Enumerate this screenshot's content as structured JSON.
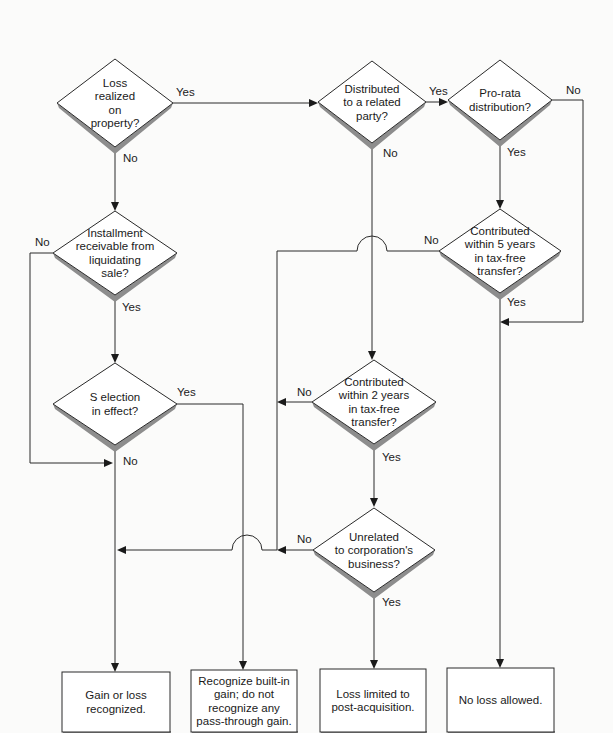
{
  "diagram": {
    "type": "flowchart",
    "decisions": [
      {
        "id": "loss_realized",
        "lines": [
          "Loss",
          "realized",
          "on",
          "property?"
        ],
        "cx": 115,
        "cy": 103,
        "hw": 58,
        "hh": 44
      },
      {
        "id": "distributed_related",
        "lines": [
          "Distributed",
          "to a related",
          "party?"
        ],
        "cx": 372,
        "cy": 102,
        "hw": 54,
        "hh": 41
      },
      {
        "id": "pro_rata",
        "lines": [
          "Pro-rata",
          "distribution?"
        ],
        "cx": 500,
        "cy": 100,
        "hw": 52,
        "hh": 40
      },
      {
        "id": "installment",
        "lines": [
          "Installment",
          "receivable from",
          "liquidating",
          "sale?"
        ],
        "cx": 115,
        "cy": 253,
        "hw": 62,
        "hh": 42
      },
      {
        "id": "contributed_5",
        "lines": [
          "Contributed",
          "within 5 years",
          "in tax-free",
          "transfer?"
        ],
        "cx": 500,
        "cy": 251,
        "hw": 61,
        "hh": 42
      },
      {
        "id": "s_election",
        "lines": [
          "S election",
          "in effect?"
        ],
        "cx": 115,
        "cy": 404,
        "hw": 62,
        "hh": 41
      },
      {
        "id": "contributed_2",
        "lines": [
          "Contributed",
          "within 2 years",
          "in tax-free",
          "transfer?"
        ],
        "cx": 374,
        "cy": 402,
        "hw": 62,
        "hh": 42
      },
      {
        "id": "unrelated",
        "lines": [
          "Unrelated",
          "to corporation's",
          "business?"
        ],
        "cx": 374,
        "cy": 550,
        "hw": 61,
        "hh": 42
      }
    ],
    "outcomes": [
      {
        "id": "gain_loss_recognized",
        "lines": [
          "Gain or loss",
          "recognized."
        ],
        "x": 62,
        "y": 672,
        "w": 108,
        "h": 60
      },
      {
        "id": "recognize_built_in",
        "lines": [
          "Recognize built-in",
          "gain; do not",
          "recognize any",
          "pass-through gain."
        ],
        "x": 191,
        "y": 670,
        "w": 106,
        "h": 62
      },
      {
        "id": "loss_limited",
        "lines": [
          "Loss limited to",
          "post-acquisition."
        ],
        "x": 320,
        "y": 669,
        "w": 106,
        "h": 63
      },
      {
        "id": "no_loss",
        "lines": [
          "No loss allowed."
        ],
        "x": 447,
        "y": 668,
        "w": 107,
        "h": 64
      }
    ],
    "edge_labels": [
      {
        "text": "Yes",
        "x": 176,
        "y": 96
      },
      {
        "text": "No",
        "x": 123,
        "y": 162
      },
      {
        "text": "Yes",
        "x": 429,
        "y": 95
      },
      {
        "text": "No",
        "x": 383,
        "y": 157
      },
      {
        "text": "No",
        "x": 566,
        "y": 94
      },
      {
        "text": "Yes",
        "x": 507,
        "y": 156
      },
      {
        "text": "No",
        "x": 35,
        "y": 246
      },
      {
        "text": "Yes",
        "x": 122,
        "y": 311
      },
      {
        "text": "No",
        "x": 424,
        "y": 244
      },
      {
        "text": "Yes",
        "x": 507,
        "y": 306
      },
      {
        "text": "Yes",
        "x": 177,
        "y": 396
      },
      {
        "text": "No",
        "x": 123,
        "y": 465
      },
      {
        "text": "No",
        "x": 297,
        "y": 396
      },
      {
        "text": "Yes",
        "x": 382,
        "y": 461
      },
      {
        "text": "No",
        "x": 297,
        "y": 543
      },
      {
        "text": "Yes",
        "x": 382,
        "y": 606
      }
    ],
    "edges": [
      {
        "from": "loss_realized",
        "to": "distributed_related",
        "label": "Yes"
      },
      {
        "from": "loss_realized",
        "to": "installment",
        "label": "No"
      },
      {
        "from": "distributed_related",
        "to": "pro_rata",
        "label": "Yes"
      },
      {
        "from": "distributed_related",
        "to": "contributed_2",
        "label": "No"
      },
      {
        "from": "pro_rata",
        "to": "contributed_5",
        "label": "Yes"
      },
      {
        "from": "pro_rata",
        "to": "no_loss",
        "label": "No"
      },
      {
        "from": "installment",
        "to": "s_election",
        "label": "Yes"
      },
      {
        "from": "installment",
        "to": "gain_loss_recognized",
        "label": "No"
      },
      {
        "from": "contributed_5",
        "to": "no_loss",
        "label": "Yes"
      },
      {
        "from": "contributed_5",
        "to": "unrelated",
        "label": "No"
      },
      {
        "from": "s_election",
        "to": "recognize_built_in",
        "label": "Yes"
      },
      {
        "from": "s_election",
        "to": "gain_loss_recognized",
        "label": "No"
      },
      {
        "from": "contributed_2",
        "to": "unrelated",
        "label": "Yes"
      },
      {
        "from": "contributed_2",
        "to": "unrelated",
        "label": "No"
      },
      {
        "from": "unrelated",
        "to": "loss_limited",
        "label": "Yes"
      },
      {
        "from": "unrelated",
        "to": "gain_loss_recognized",
        "label": "No"
      }
    ],
    "paths": [
      {
        "d": "M173 103 L316 103",
        "arrow": [
          318,
          103,
          "right"
        ]
      },
      {
        "d": "M115 147 L115 209",
        "arrow": [
          115,
          211,
          "down"
        ]
      },
      {
        "d": "M426 102 L446 102",
        "arrow": [
          448,
          102,
          "right"
        ]
      },
      {
        "d": "M552 100 L583 100 L583 322 L502 322",
        "arrow": [
          500,
          322,
          "left"
        ]
      },
      {
        "d": "M500 140 L500 207",
        "arrow": [
          500,
          209,
          "down"
        ]
      },
      {
        "d": "M372 143 L372 358",
        "arrow": [
          372,
          360,
          "down"
        ]
      },
      {
        "d": "M500 293 L500 666",
        "arrow": [
          500,
          668,
          "down"
        ]
      },
      {
        "d": "M53 253 L30 253 L30 463 L111 463",
        "arrow": [
          113,
          463,
          "right"
        ]
      },
      {
        "d": "M115 295 L115 361",
        "arrow": [
          115,
          363,
          "down"
        ]
      },
      {
        "d": "M439 251 L387 251 A15 15 0 0 0 357 251 L277 251 L277 550 L262 550 A15 15 0 0 0 232 550 L119 550",
        "arrow": [
          117,
          550,
          "left"
        ]
      },
      {
        "d": "M177 404 L243 404 L243 668",
        "arrow": [
          243,
          670,
          "down"
        ]
      },
      {
        "d": "M115 445 L115 670",
        "arrow": [
          115,
          672,
          "down"
        ]
      },
      {
        "d": "M312 402 L279 402",
        "arrow": [
          277,
          402,
          "left"
        ]
      },
      {
        "d": "M374 444 L374 505",
        "arrow": [
          374,
          507,
          "down"
        ]
      },
      {
        "d": "M313 550 L279 550",
        "arrow": [
          277,
          550,
          "left"
        ]
      },
      {
        "d": "M374 592 L374 667",
        "arrow": [
          374,
          669,
          "down"
        ]
      }
    ]
  }
}
